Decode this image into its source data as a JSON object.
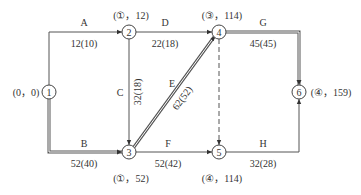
{
  "diagram": {
    "type": "network-diagram",
    "colors": {
      "line": "#555555",
      "text": "#333333",
      "critical_fill": "#ffffff"
    },
    "nodes": [
      {
        "id": "1",
        "label": "1",
        "annotation": "(0，0)"
      },
      {
        "id": "2",
        "label": "2",
        "annotation": "(①，12)"
      },
      {
        "id": "3",
        "label": "3",
        "annotation": "(①，52)"
      },
      {
        "id": "4",
        "label": "4",
        "annotation": "(③，114)"
      },
      {
        "id": "5",
        "label": "5",
        "annotation": "(④，114)"
      },
      {
        "id": "6",
        "label": "6",
        "annotation": "(④，159)"
      }
    ],
    "edges": [
      {
        "id": "A",
        "from": "1",
        "to": "2",
        "name": "A",
        "value": "12(10)",
        "critical": false,
        "dummy": false
      },
      {
        "id": "B",
        "from": "1",
        "to": "3",
        "name": "B",
        "value": "52(40)",
        "critical": true,
        "dummy": false
      },
      {
        "id": "C",
        "from": "2",
        "to": "3",
        "name": "C",
        "value": "32(18)",
        "critical": false,
        "dummy": false
      },
      {
        "id": "D",
        "from": "2",
        "to": "4",
        "name": "D",
        "value": "22(18)",
        "critical": false,
        "dummy": false
      },
      {
        "id": "E",
        "from": "3",
        "to": "4",
        "name": "E",
        "value": "62(52)",
        "critical": true,
        "dummy": false
      },
      {
        "id": "F",
        "from": "3",
        "to": "5",
        "name": "F",
        "value": "52(42)",
        "critical": false,
        "dummy": false
      },
      {
        "id": "dummy",
        "from": "4",
        "to": "5",
        "name": "",
        "value": "",
        "critical": false,
        "dummy": true
      },
      {
        "id": "G",
        "from": "4",
        "to": "6",
        "name": "G",
        "value": "45(45)",
        "critical": true,
        "dummy": false
      },
      {
        "id": "H",
        "from": "5",
        "to": "6",
        "name": "H",
        "value": "32(28)",
        "critical": false,
        "dummy": false
      }
    ]
  }
}
